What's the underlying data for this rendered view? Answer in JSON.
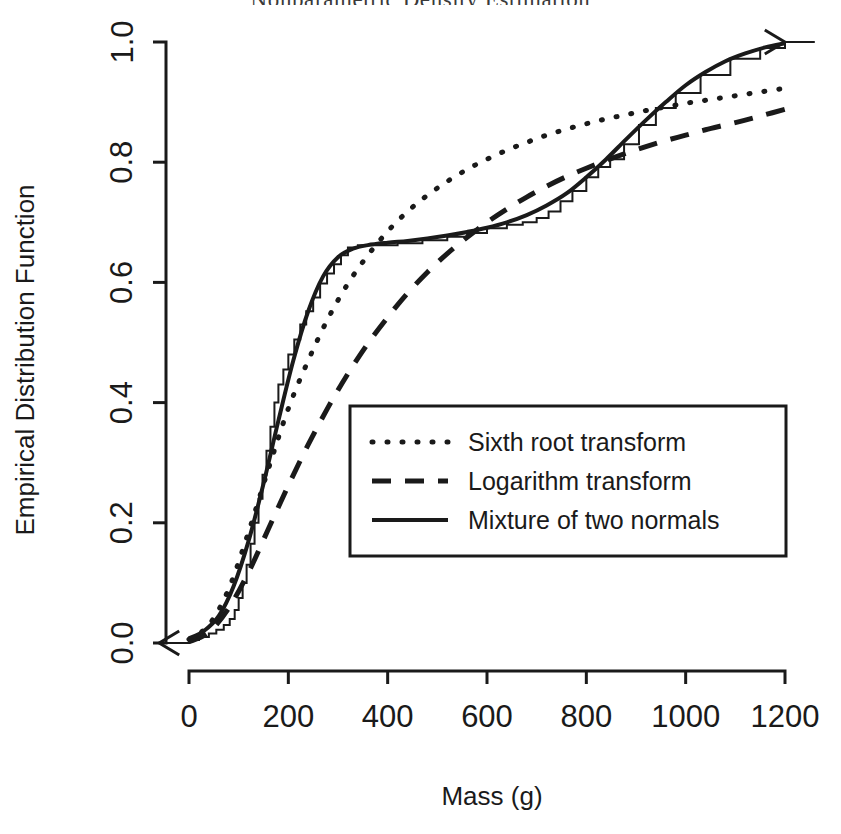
{
  "figure": {
    "clipped_header_text": "Nonparametric Density Estimation",
    "background_color": "#ffffff",
    "ink_color": "#1a1a1a"
  },
  "axes": {
    "y_label": "Empirical Distribution Function",
    "x_label": "Mass (g)",
    "x_ticks": [
      "0",
      "200",
      "400",
      "600",
      "800",
      "1000",
      "1200"
    ],
    "y_ticks": [
      "0.0",
      "0.2",
      "0.4",
      "0.6",
      "0.8",
      "1.0"
    ]
  },
  "legend": {
    "items": [
      {
        "label": "Sixth root transform",
        "style": "dotted"
      },
      {
        "label": "Logarithm transform",
        "style": "dashed"
      },
      {
        "label": "Mixture of two normals",
        "style": "solid"
      }
    ]
  },
  "chart_data": {
    "type": "line",
    "title": "",
    "xlabel": "Mass (g)",
    "ylabel": "Empirical Distribution Function",
    "xlim": [
      0,
      1200
    ],
    "ylim": [
      0.0,
      1.0
    ],
    "grid": false,
    "legend_position": "center-right-inside",
    "x_ticks": [
      0,
      200,
      400,
      600,
      800,
      1000,
      1200
    ],
    "y_ticks": [
      0.0,
      0.2,
      0.4,
      0.6,
      0.8,
      1.0
    ],
    "ecdf": {
      "name": "Empirical distribution function (step)",
      "style": "step",
      "left_arrow_at_y": 0.0,
      "right_arrow_at_y": 1.0,
      "x": [
        0,
        20,
        40,
        55,
        70,
        82,
        92,
        100,
        108,
        116,
        124,
        132,
        140,
        148,
        156,
        164,
        172,
        180,
        190,
        200,
        212,
        224,
        236,
        250,
        264,
        278,
        292,
        306,
        320,
        340,
        420,
        470,
        520,
        560,
        600,
        640,
        672,
        700,
        724,
        748,
        772,
        800,
        824,
        848,
        876,
        906,
        940,
        980,
        1030,
        1090,
        1150,
        1200
      ],
      "y": [
        0.005,
        0.01,
        0.016,
        0.022,
        0.03,
        0.04,
        0.055,
        0.075,
        0.1,
        0.13,
        0.165,
        0.2,
        0.24,
        0.28,
        0.32,
        0.36,
        0.4,
        0.43,
        0.455,
        0.48,
        0.505,
        0.53,
        0.552,
        0.575,
        0.598,
        0.615,
        0.63,
        0.645,
        0.658,
        0.662,
        0.665,
        0.67,
        0.676,
        0.682,
        0.69,
        0.696,
        0.7,
        0.707,
        0.718,
        0.735,
        0.752,
        0.775,
        0.792,
        0.805,
        0.83,
        0.862,
        0.89,
        0.915,
        0.945,
        0.972,
        0.99,
        1.0
      ]
    },
    "series": [
      {
        "name": "Sixth root transform",
        "style": "dotted",
        "x": [
          0,
          40,
          80,
          120,
          160,
          200,
          240,
          280,
          320,
          360,
          400,
          440,
          480,
          520,
          560,
          600,
          640,
          680,
          720,
          760,
          800,
          840,
          880,
          920,
          960,
          1000,
          1040,
          1080,
          1120,
          1160,
          1200
        ],
        "y": [
          0.006,
          0.03,
          0.09,
          0.185,
          0.29,
          0.39,
          0.47,
          0.54,
          0.598,
          0.645,
          0.685,
          0.718,
          0.745,
          0.768,
          0.788,
          0.805,
          0.82,
          0.833,
          0.845,
          0.855,
          0.864,
          0.872,
          0.879,
          0.886,
          0.892,
          0.898,
          0.903,
          0.908,
          0.913,
          0.918,
          0.923
        ]
      },
      {
        "name": "Logarithm transform",
        "style": "dashed",
        "x": [
          0,
          40,
          80,
          120,
          160,
          200,
          240,
          280,
          320,
          360,
          400,
          440,
          480,
          520,
          560,
          600,
          640,
          680,
          720,
          760,
          800,
          840,
          880,
          920,
          960,
          1000,
          1040,
          1080,
          1120,
          1160,
          1200
        ],
        "y": [
          0.002,
          0.018,
          0.058,
          0.118,
          0.19,
          0.262,
          0.33,
          0.392,
          0.448,
          0.498,
          0.542,
          0.582,
          0.617,
          0.648,
          0.675,
          0.7,
          0.722,
          0.742,
          0.76,
          0.776,
          0.79,
          0.803,
          0.815,
          0.826,
          0.836,
          0.845,
          0.854,
          0.862,
          0.87,
          0.879,
          0.888
        ]
      },
      {
        "name": "Mixture of two normals",
        "style": "solid",
        "x": [
          0,
          30,
          60,
          90,
          120,
          150,
          180,
          210,
          240,
          270,
          300,
          330,
          360,
          400,
          440,
          480,
          520,
          560,
          600,
          640,
          680,
          720,
          760,
          800,
          840,
          880,
          920,
          960,
          1000,
          1040,
          1080,
          1120,
          1160,
          1200
        ],
        "y": [
          0.008,
          0.02,
          0.045,
          0.095,
          0.17,
          0.265,
          0.37,
          0.47,
          0.552,
          0.61,
          0.642,
          0.656,
          0.662,
          0.666,
          0.669,
          0.673,
          0.678,
          0.684,
          0.691,
          0.7,
          0.712,
          0.728,
          0.748,
          0.775,
          0.805,
          0.838,
          0.87,
          0.9,
          0.928,
          0.95,
          0.968,
          0.981,
          0.991,
          0.998
        ]
      }
    ]
  }
}
